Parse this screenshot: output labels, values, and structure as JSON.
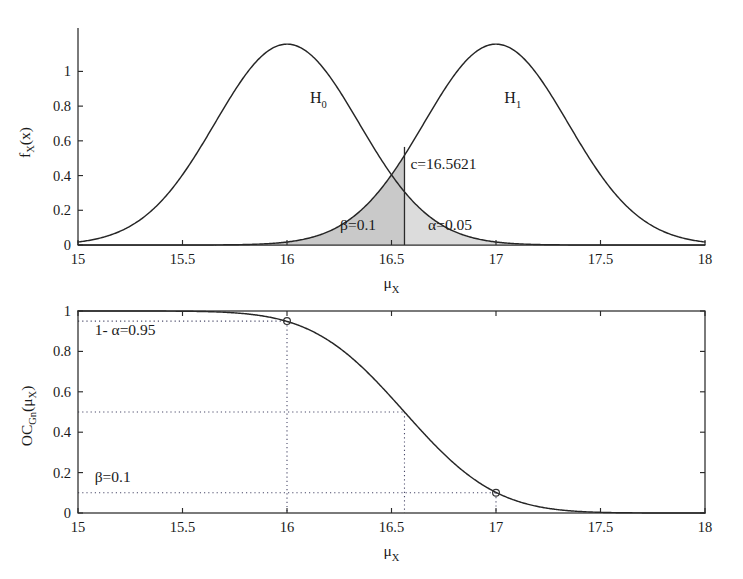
{
  "figure": {
    "title": "",
    "background_color": "#ffffff",
    "ink_color": "#1a1a1a"
  },
  "chart_data": [
    {
      "type": "line",
      "id": "pdf-panel",
      "title": "",
      "xlabel": "μ_X",
      "ylabel": "f_X(x)",
      "xlim": [
        15,
        18
      ],
      "ylim": [
        0,
        1.25
      ],
      "xticks": [
        15,
        15.5,
        16,
        16.5,
        17,
        17.5,
        18
      ],
      "xtick_labels": [
        "15",
        "15.5",
        "16",
        "16.5",
        "17",
        "17.5",
        "18"
      ],
      "yticks": [
        0,
        0.2,
        0.4,
        0.6,
        0.8,
        1
      ],
      "ytick_labels": [
        "0",
        "0.2",
        "0.4",
        "0.6",
        "0.8",
        "1"
      ],
      "grid": false,
      "legend": "none",
      "series": [
        {
          "name": "H0",
          "distribution": "normal",
          "mean": 16,
          "sigma": 0.3448,
          "peak": 1.157,
          "label": "H",
          "label_sub": "0",
          "label_x": 16.15,
          "label_y": 0.82
        },
        {
          "name": "H1",
          "distribution": "normal",
          "mean": 17,
          "sigma": 0.3448,
          "peak": 1.157,
          "label": "H",
          "label_sub": "1",
          "label_y": 0.82,
          "label_x": 17.08
        }
      ],
      "critical_value": {
        "label": "c=16.5621",
        "value": 16.5621,
        "line_top": 0.565
      },
      "shaded_regions": [
        {
          "name": "beta",
          "label": "β=0.1",
          "value": 0.1,
          "from": 15.0,
          "to": 16.5621,
          "under": "H1",
          "fill": "#c9c9c9"
        },
        {
          "name": "alpha",
          "label": "α=0.05",
          "value": 0.05,
          "from": 16.5621,
          "to": 18.0,
          "under": "H0",
          "fill": "#dcdcdc"
        }
      ]
    },
    {
      "type": "line",
      "id": "oc-panel",
      "title": "",
      "xlabel": "μ_X",
      "ylabel": "OC_Gn(μ_X)",
      "ylabel_main": "OC",
      "ylabel_sub": "Gn",
      "ylabel_tail": "(μ",
      "ylabel_tail_sub": "X",
      "ylabel_tail_end": ")",
      "xlim": [
        15,
        18
      ],
      "ylim": [
        0,
        1
      ],
      "xticks": [
        15,
        15.5,
        16,
        16.5,
        17,
        17.5,
        18
      ],
      "xtick_labels": [
        "15",
        "15.5",
        "16",
        "16.5",
        "17",
        "17.5",
        "18"
      ],
      "yticks": [
        0,
        0.2,
        0.4,
        0.6,
        0.8,
        1
      ],
      "ytick_labels": [
        "0",
        "0.2",
        "0.4",
        "0.6",
        "0.8",
        "1"
      ],
      "grid": false,
      "box_frame": true,
      "legend": "none",
      "curve": {
        "name": "OC curve",
        "description": "Operating characteristic: P(accept H0 | mu)",
        "critical_value": 16.5621,
        "sigma": 0.3448,
        "x": [
          15.0,
          15.25,
          15.5,
          15.75,
          16.0,
          16.1,
          16.2,
          16.3,
          16.4,
          16.5,
          16.5621,
          16.6,
          16.7,
          16.8,
          16.9,
          17.0,
          17.1,
          17.25,
          17.5,
          17.75,
          18.0
        ],
        "y": [
          1.0,
          1.0,
          0.999,
          0.991,
          0.95,
          0.917,
          0.866,
          0.796,
          0.707,
          0.604,
          0.5,
          0.495,
          0.39,
          0.293,
          0.204,
          0.1,
          0.093,
          0.044,
          0.008,
          0.001,
          0.0
        ]
      },
      "annotations": [
        {
          "name": "one-minus-alpha",
          "text": "1- α=0.95",
          "value": 0.95,
          "x": 15.08,
          "y": 0.88
        },
        {
          "name": "beta",
          "text": "β=0.1",
          "value": 0.1,
          "x": 15.08,
          "y": 0.155
        }
      ],
      "guide_lines": [
        {
          "name": "guide-095",
          "y": 0.95,
          "x_to": 16.0
        },
        {
          "name": "guide-050",
          "y": 0.5,
          "x_to": 16.5621
        },
        {
          "name": "guide-010",
          "y": 0.1,
          "x_to": 17.0
        },
        {
          "name": "guide-v-16",
          "x": 16.0,
          "y_from": 0.95
        },
        {
          "name": "guide-v-c",
          "x": 16.5621,
          "y_from": 0.5
        },
        {
          "name": "guide-v-17",
          "x": 17.0,
          "y_from": 0.1
        }
      ],
      "markers": [
        {
          "name": "marker-16",
          "x": 16.0,
          "y": 0.95
        },
        {
          "name": "marker-17",
          "x": 17.0,
          "y": 0.1
        }
      ]
    }
  ]
}
